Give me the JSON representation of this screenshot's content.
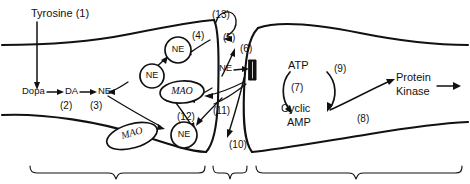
{
  "figure": {
    "kind": "noradrenergic-synapse-diagram",
    "background": "#ffffff",
    "ink": "#111111"
  },
  "labels": {
    "tyrosine": "Tyrosine (1)",
    "dopa": "Dopa",
    "da": "DA",
    "ne_cytoplasm": "NE",
    "n2": "(2)",
    "n3": "(3)",
    "n4": "(4)",
    "n5": "(5)",
    "n6": "(6)",
    "n7": "(7)",
    "n8": "(8)",
    "n9": "(9)",
    "n10": "(10)",
    "n11": "(11)",
    "n12": "(12)",
    "n13": "(13)",
    "ne_cleft": "NE",
    "atp": "ATP",
    "cyclic": "Cyclic",
    "amp": "AMP",
    "protein": "Protein",
    "kinase": "Kinase"
  },
  "vesicles": [
    {
      "id": "vesicle-ne-upper",
      "label": "NE"
    },
    {
      "id": "vesicle-ne-mid",
      "label": "NE"
    },
    {
      "id": "vesicle-ne-lower",
      "label": "NE"
    }
  ],
  "enzymes": [
    {
      "id": "mao-upper",
      "label": "MAO"
    },
    {
      "id": "mao-lower",
      "label": "MAO"
    }
  ],
  "regions": [
    {
      "id": "presynaptic-terminal-brace"
    },
    {
      "id": "synaptic-cleft-brace"
    },
    {
      "id": "postsynaptic-cell-brace"
    }
  ],
  "receptor": {
    "id": "postsynaptic-receptor",
    "color": "#111111"
  }
}
